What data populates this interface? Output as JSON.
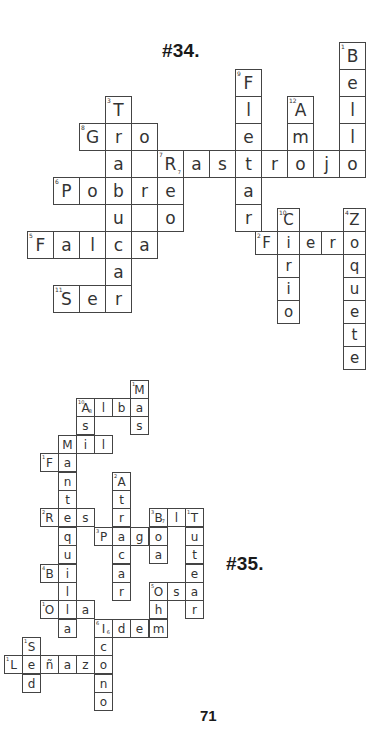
{
  "page": {
    "number": "71"
  },
  "puzzles": [
    {
      "id": "34",
      "title": "#34.",
      "title_pos": [
        162,
        40
      ],
      "cell_w": 26,
      "cell_h": 27,
      "font_size": 17,
      "cells": [
        {
          "x": 339,
          "y": 42,
          "ch": "B",
          "n": "1"
        },
        {
          "x": 339,
          "y": 69,
          "ch": "e"
        },
        {
          "x": 339,
          "y": 96,
          "ch": "l"
        },
        {
          "x": 339,
          "y": 123,
          "ch": "l"
        },
        {
          "x": 235,
          "y": 69,
          "ch": "F",
          "n": "9"
        },
        {
          "x": 235,
          "y": 96,
          "ch": "l"
        },
        {
          "x": 235,
          "y": 123,
          "ch": "e"
        },
        {
          "x": 235,
          "y": 177,
          "ch": "a"
        },
        {
          "x": 235,
          "y": 204,
          "ch": "r"
        },
        {
          "x": 287,
          "y": 96,
          "ch": "A",
          "n": "12"
        },
        {
          "x": 287,
          "y": 123,
          "ch": "m"
        },
        {
          "x": 105,
          "y": 96,
          "ch": "T",
          "n": "3"
        },
        {
          "x": 79,
          "y": 123,
          "ch": "G",
          "n": "8"
        },
        {
          "x": 105,
          "y": 123,
          "ch": "r"
        },
        {
          "x": 131,
          "y": 123,
          "ch": "o"
        },
        {
          "x": 105,
          "y": 150,
          "ch": "a"
        },
        {
          "x": 131,
          "y": 150,
          "ch": ""
        },
        {
          "x": 157,
          "y": 150,
          "ch": "R",
          "n": "7",
          "sub": "7"
        },
        {
          "x": 183,
          "y": 150,
          "ch": "a"
        },
        {
          "x": 209,
          "y": 150,
          "ch": "s"
        },
        {
          "x": 235,
          "y": 150,
          "ch": "t"
        },
        {
          "x": 261,
          "y": 150,
          "ch": "r"
        },
        {
          "x": 287,
          "y": 150,
          "ch": "o"
        },
        {
          "x": 313,
          "y": 150,
          "ch": "j"
        },
        {
          "x": 339,
          "y": 150,
          "ch": "o"
        },
        {
          "x": 53,
          "y": 177,
          "ch": "P",
          "n": "6"
        },
        {
          "x": 79,
          "y": 177,
          "ch": "o"
        },
        {
          "x": 105,
          "y": 177,
          "ch": "b"
        },
        {
          "x": 131,
          "y": 177,
          "ch": "r"
        },
        {
          "x": 157,
          "y": 177,
          "ch": "e"
        },
        {
          "x": 105,
          "y": 204,
          "ch": "u"
        },
        {
          "x": 131,
          "y": 204,
          "ch": ""
        },
        {
          "x": 157,
          "y": 204,
          "ch": "o"
        },
        {
          "x": 27,
          "y": 231,
          "ch": "F",
          "n": "5"
        },
        {
          "x": 53,
          "y": 231,
          "ch": "a"
        },
        {
          "x": 79,
          "y": 231,
          "ch": "l"
        },
        {
          "x": 105,
          "y": 231,
          "ch": "c"
        },
        {
          "x": 131,
          "y": 231,
          "ch": "a"
        },
        {
          "x": 105,
          "y": 258,
          "ch": "a"
        },
        {
          "x": 53,
          "y": 285,
          "ch": "S",
          "n": "11"
        },
        {
          "x": 79,
          "y": 285,
          "ch": "e"
        },
        {
          "x": 105,
          "y": 285,
          "ch": "r"
        }
      ],
      "cells_small": [
        {
          "x": 277,
          "y": 208,
          "ch": "C",
          "n": "10"
        },
        {
          "x": 343,
          "y": 208,
          "ch": "Z",
          "n": "4"
        },
        {
          "x": 255,
          "y": 231,
          "ch": "F",
          "n": "2"
        },
        {
          "x": 277,
          "y": 231,
          "ch": "i"
        },
        {
          "x": 299,
          "y": 231,
          "ch": "e"
        },
        {
          "x": 321,
          "y": 231,
          "ch": "r"
        },
        {
          "x": 343,
          "y": 231,
          "ch": "o"
        },
        {
          "x": 277,
          "y": 254,
          "ch": "r"
        },
        {
          "x": 277,
          "y": 277,
          "ch": "i"
        },
        {
          "x": 277,
          "y": 300,
          "ch": "o"
        },
        {
          "x": 343,
          "y": 254,
          "ch": "q"
        },
        {
          "x": 343,
          "y": 277,
          "ch": "u"
        },
        {
          "x": 343,
          "y": 300,
          "ch": "e"
        },
        {
          "x": 343,
          "y": 323,
          "ch": "t"
        },
        {
          "x": 343,
          "y": 346,
          "ch": "e"
        }
      ]
    },
    {
      "id": "35",
      "title": "#35.",
      "title_pos": [
        226,
        555
      ],
      "cell_w": 19,
      "cell_h": 19,
      "font_size": 12,
      "cells": [
        {
          "x": 130,
          "y": 380,
          "ch": "M",
          "n": "1"
        },
        {
          "x": 76,
          "y": 398,
          "ch": "A",
          "n": "10",
          "sub": "8"
        },
        {
          "x": 94,
          "y": 398,
          "ch": "l"
        },
        {
          "x": 112,
          "y": 398,
          "ch": "b"
        },
        {
          "x": 130,
          "y": 398,
          "ch": "a"
        },
        {
          "x": 76,
          "y": 416,
          "ch": "s"
        },
        {
          "x": 130,
          "y": 416,
          "ch": "s"
        },
        {
          "x": 58,
          "y": 435,
          "ch": "M"
        },
        {
          "x": 76,
          "y": 435,
          "ch": "i"
        },
        {
          "x": 94,
          "y": 435,
          "ch": "l"
        },
        {
          "x": 40,
          "y": 453,
          "ch": "F",
          "n": "1"
        },
        {
          "x": 58,
          "y": 453,
          "ch": "a"
        },
        {
          "x": 58,
          "y": 472,
          "ch": "n"
        },
        {
          "x": 112,
          "y": 472,
          "ch": "A",
          "n": "2"
        },
        {
          "x": 58,
          "y": 490,
          "ch": "t"
        },
        {
          "x": 112,
          "y": 490,
          "ch": "t"
        },
        {
          "x": 40,
          "y": 508,
          "ch": "R",
          "n": "2"
        },
        {
          "x": 58,
          "y": 508,
          "ch": "e"
        },
        {
          "x": 76,
          "y": 508,
          "ch": "s"
        },
        {
          "x": 112,
          "y": 508,
          "ch": "r"
        },
        {
          "x": 149,
          "y": 508,
          "ch": "B",
          "n": "3",
          "sub": "7"
        },
        {
          "x": 167,
          "y": 508,
          "ch": "l"
        },
        {
          "x": 185,
          "y": 508,
          "ch": "T",
          "n": "1"
        },
        {
          "x": 58,
          "y": 527,
          "ch": "q"
        },
        {
          "x": 94,
          "y": 527,
          "ch": "P",
          "n": "3"
        },
        {
          "x": 112,
          "y": 527,
          "ch": "a"
        },
        {
          "x": 130,
          "y": 527,
          "ch": "g"
        },
        {
          "x": 149,
          "y": 527,
          "ch": "o"
        },
        {
          "x": 185,
          "y": 527,
          "ch": "u"
        },
        {
          "x": 58,
          "y": 545,
          "ch": "u"
        },
        {
          "x": 112,
          "y": 545,
          "ch": "c"
        },
        {
          "x": 149,
          "y": 545,
          "ch": "a"
        },
        {
          "x": 185,
          "y": 545,
          "ch": "t"
        },
        {
          "x": 40,
          "y": 564,
          "ch": "B",
          "n": "4"
        },
        {
          "x": 58,
          "y": 564,
          "ch": "i"
        },
        {
          "x": 112,
          "y": 564,
          "ch": "a"
        },
        {
          "x": 185,
          "y": 564,
          "ch": "e"
        },
        {
          "x": 58,
          "y": 582,
          "ch": "l"
        },
        {
          "x": 112,
          "y": 582,
          "ch": "r"
        },
        {
          "x": 149,
          "y": 582,
          "ch": "O",
          "n": "5"
        },
        {
          "x": 167,
          "y": 582,
          "ch": "s"
        },
        {
          "x": 185,
          "y": 582,
          "ch": "a"
        },
        {
          "x": 40,
          "y": 600,
          "ch": "O",
          "n": "1"
        },
        {
          "x": 58,
          "y": 600,
          "ch": "l"
        },
        {
          "x": 76,
          "y": 600,
          "ch": "a"
        },
        {
          "x": 149,
          "y": 600,
          "ch": "h"
        },
        {
          "x": 185,
          "y": 600,
          "ch": "r"
        },
        {
          "x": 58,
          "y": 619,
          "ch": "a"
        },
        {
          "x": 94,
          "y": 619,
          "ch": "I",
          "n": "6",
          "sub": "6"
        },
        {
          "x": 112,
          "y": 619,
          "ch": "d"
        },
        {
          "x": 130,
          "y": 619,
          "ch": "e"
        },
        {
          "x": 149,
          "y": 619,
          "ch": "m"
        },
        {
          "x": 22,
          "y": 637,
          "ch": "S",
          "n": "1"
        },
        {
          "x": 94,
          "y": 637,
          "ch": "c"
        },
        {
          "x": 4,
          "y": 655,
          "ch": "L",
          "n": "1"
        },
        {
          "x": 22,
          "y": 655,
          "ch": "e"
        },
        {
          "x": 40,
          "y": 655,
          "ch": "ñ"
        },
        {
          "x": 58,
          "y": 655,
          "ch": "a"
        },
        {
          "x": 76,
          "y": 655,
          "ch": "z"
        },
        {
          "x": 94,
          "y": 655,
          "ch": "o"
        },
        {
          "x": 22,
          "y": 674,
          "ch": "d"
        },
        {
          "x": 94,
          "y": 674,
          "ch": "n"
        },
        {
          "x": 94,
          "y": 692,
          "ch": "o"
        }
      ]
    }
  ],
  "page_number_pos": [
    200,
    708
  ]
}
